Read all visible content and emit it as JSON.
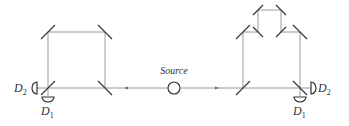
{
  "diagram": {
    "type": "dual Mach-Zehnder interferometer",
    "source": {
      "label": "Source"
    },
    "left_interferometer": {
      "detectors": [
        {
          "label": "D",
          "subscript": "2",
          "position": "left"
        },
        {
          "label": "D",
          "subscript": "1",
          "position": "below"
        }
      ]
    },
    "right_interferometer": {
      "has_delay_loop": true,
      "detectors": [
        {
          "label": "D",
          "subscript": "2",
          "position": "right"
        },
        {
          "label": "D",
          "subscript": "1",
          "position": "below"
        }
      ]
    },
    "colors": {
      "beam": "#9a9a9a",
      "mirror": "#3a3a3a",
      "text": "#333333"
    }
  }
}
